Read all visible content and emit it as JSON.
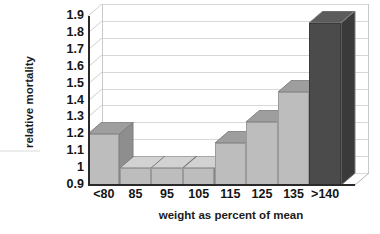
{
  "chart_data": {
    "type": "bar",
    "title": "",
    "subtitle": "",
    "xlabel": "weight as percent of mean",
    "ylabel": "relative mortality",
    "categories": [
      "<80",
      "85",
      "95",
      "105",
      "115",
      "125",
      "135",
      ">140"
    ],
    "values": [
      1.2,
      1.0,
      1.0,
      1.0,
      1.15,
      1.27,
      1.45,
      1.86
    ],
    "series": [
      {
        "name": "relative mortality",
        "values": [
          1.2,
          1.0,
          1.0,
          1.0,
          1.15,
          1.27,
          1.45,
          1.86
        ]
      }
    ],
    "ylim": [
      0.9,
      1.9
    ],
    "ytick_values": [
      1.9,
      1.8,
      1.7,
      1.6,
      1.5,
      1.4,
      1.3,
      1.2,
      1.1,
      1.0,
      0.9
    ],
    "ytick_labels": [
      "1.9",
      "1.8",
      "1.7",
      "1.6",
      "1.5",
      "1.4",
      "1.3",
      "1.2",
      "1.1",
      "1",
      "0.9"
    ],
    "grid": true,
    "grid_axis": "y",
    "legend": false,
    "legend_position": "none",
    "style": "3d-column",
    "bar_colors": [
      "#bdbdbd",
      "#bdbdbd",
      "#bdbdbd",
      "#bdbdbd",
      "#bdbdbd",
      "#bdbdbd",
      "#bdbdbd",
      "#4b4b4b"
    ],
    "bar_side_colors": [
      "#8e8e8e",
      "#8e8e8e",
      "#8e8e8e",
      "#8e8e8e",
      "#8e8e8e",
      "#8e8e8e",
      "#8e8e8e",
      "#3a3a3a"
    ],
    "bar_top_colors": [
      "#9e9e9e",
      "#d2d2d2",
      "#d2d2d2",
      "#d2d2d2",
      "#9e9e9e",
      "#9e9e9e",
      "#9e9e9e",
      "#5c5c5c"
    ],
    "annotations": [],
    "colors": {
      "background": "#ffffff",
      "axis": "#2a2a2a",
      "gridline": "#c9c9c9",
      "text": "#141414"
    }
  }
}
